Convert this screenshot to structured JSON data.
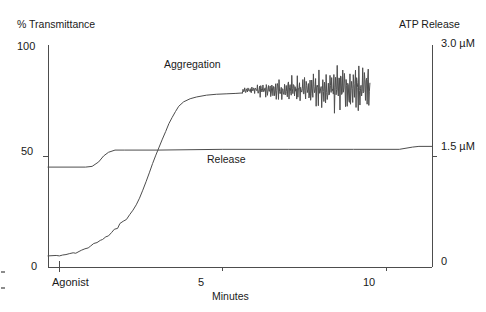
{
  "chart_data": {
    "type": "line",
    "title": "",
    "subtitle": "",
    "xlabel": "Minutes",
    "ylabel": "% Transmittance",
    "y2label": "ATP Release",
    "xlim": [
      -0.35,
      11.4
    ],
    "ylim": [
      0,
      100
    ],
    "y2lim": [
      0,
      3.0
    ],
    "grid": false,
    "legend_position": "inline-annotations",
    "xticks": [
      5,
      10
    ],
    "xticklabels": [
      "5",
      "10"
    ],
    "x_event_tick": 0,
    "x_event_label": "Agonist",
    "yticks": [
      0,
      50,
      100
    ],
    "yticklabels": [
      "0",
      "50",
      "100"
    ],
    "y2ticks": [
      0,
      1.5,
      3.0
    ],
    "y2ticklabels": [
      "0",
      "1.5 µM",
      "3.0 µM"
    ],
    "line_color": "#4d4d4d",
    "axis_color": "#4d4d4d",
    "text_color": "#1a1a1a",
    "series": [
      {
        "name": "Aggregation",
        "axis": "left",
        "label_x": 5.1,
        "label_y": 90,
        "x": [
          -0.35,
          -0.1,
          0.0,
          0.1,
          0.2,
          0.3,
          0.42,
          0.5,
          0.6,
          0.68,
          0.78,
          0.88,
          0.95,
          1.05,
          1.15,
          1.25,
          1.32,
          1.42,
          1.5,
          1.6,
          1.68,
          1.78,
          1.85,
          1.95,
          2.05,
          2.15,
          2.25,
          2.35,
          2.45,
          2.55,
          2.65,
          2.75,
          2.85,
          2.95,
          3.05,
          3.15,
          3.25,
          3.35,
          3.45,
          3.55,
          3.65,
          3.8,
          4.0,
          4.2,
          4.5,
          4.8,
          5.1,
          5.4,
          5.6
        ],
        "y": [
          5.0,
          5.2,
          5.0,
          5.4,
          5.6,
          6.0,
          6.4,
          6.2,
          7.0,
          7.6,
          8.2,
          8.6,
          9.4,
          10.6,
          11.0,
          12.0,
          12.4,
          13.6,
          14.0,
          15.6,
          17.0,
          17.4,
          19.6,
          20.6,
          21.4,
          23.6,
          25.6,
          28.0,
          31.0,
          34.6,
          38.4,
          42.4,
          46.6,
          50.4,
          54.0,
          57.6,
          61.0,
          64.6,
          67.4,
          70.0,
          72.4,
          74.4,
          75.8,
          76.6,
          77.4,
          77.8,
          78.0,
          78.2,
          78.4
        ]
      },
      {
        "name": "Aggregation-oscillating",
        "axis": "left",
        "x_start": 5.6,
        "x_end": 9.5,
        "baseline": 79.5,
        "description": "high-frequency oscillation, amplitude grows from ~2 to ~10 % transmittance"
      },
      {
        "name": "Release",
        "axis": "right",
        "label_x": 4.4,
        "label_y": 41,
        "x": [
          -0.35,
          0.8,
          1.0,
          1.2,
          1.35,
          1.5,
          1.7,
          2.0,
          3.0,
          5.0,
          7.0,
          9.0,
          10.4,
          10.8,
          11.0,
          11.4
        ],
        "y": [
          1.35,
          1.35,
          1.36,
          1.42,
          1.5,
          1.55,
          1.58,
          1.58,
          1.58,
          1.59,
          1.59,
          1.59,
          1.59,
          1.62,
          1.63,
          1.63
        ]
      }
    ],
    "annotations": [
      {
        "text": "Aggregation",
        "x": 5.1,
        "y": 90
      },
      {
        "text": "Release",
        "x": 4.4,
        "y": 41
      }
    ]
  },
  "axes": {
    "left": {
      "name": "% Transmittance",
      "ticks": [
        {
          "label": "100",
          "value": 100
        },
        {
          "label": "50",
          "value": 50
        },
        {
          "label": "0",
          "value": 0
        }
      ]
    },
    "right": {
      "name": "ATP Release",
      "ticks": [
        {
          "label": "3.0 µM",
          "value": 3.0
        },
        {
          "label": "1.5 µM",
          "value": 1.5
        },
        {
          "label": "0",
          "value": 0
        }
      ]
    },
    "bottom": {
      "name": "Minutes",
      "ticks": [
        {
          "label": "Agonist",
          "value": 0
        },
        {
          "label": "5",
          "value": 5
        },
        {
          "label": "10",
          "value": 10
        }
      ]
    }
  }
}
